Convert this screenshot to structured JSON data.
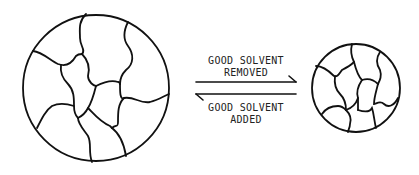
{
  "diagram": {
    "type": "reversible-process",
    "left_state": {
      "label": "swollen gel network",
      "shape": "large-circle"
    },
    "right_state": {
      "label": "collapsed gel network",
      "shape": "small-circle"
    },
    "forward_arrow": {
      "line1": "GOOD SOLVENT",
      "line2": "REMOVED",
      "direction": "right"
    },
    "reverse_arrow": {
      "line1": "GOOD SOLVENT",
      "line2": "ADDED",
      "direction": "left"
    },
    "colors": {
      "stroke": "#111111",
      "background": "#ffffff",
      "text": "#222222"
    }
  }
}
